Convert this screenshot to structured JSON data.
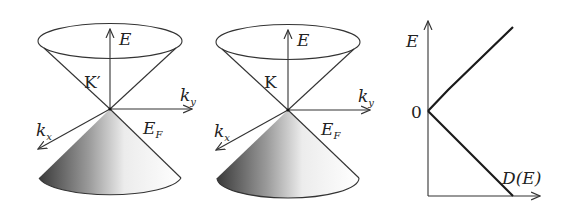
{
  "figure": {
    "panels": [
      {
        "id": "cone-kprime",
        "valley_label": "K′",
        "axes": {
          "energy": "E",
          "kx": "k",
          "kx_sub": "x",
          "ky": "k",
          "ky_sub": "y"
        },
        "fermi_label": "E",
        "fermi_sub": "F"
      },
      {
        "id": "cone-k",
        "valley_label": "K",
        "axes": {
          "energy": "E",
          "kx": "k",
          "kx_sub": "x",
          "ky": "k",
          "ky_sub": "y"
        },
        "fermi_label": "E",
        "fermi_sub": "F"
      }
    ],
    "dos_plot": {
      "y_axis_label": "E",
      "x_axis_label": "D(E)",
      "zero_tick": "0"
    },
    "colors": {
      "line": "#1a1a1a",
      "shade_dark": "#3a3a3a",
      "background": "#ffffff"
    }
  }
}
